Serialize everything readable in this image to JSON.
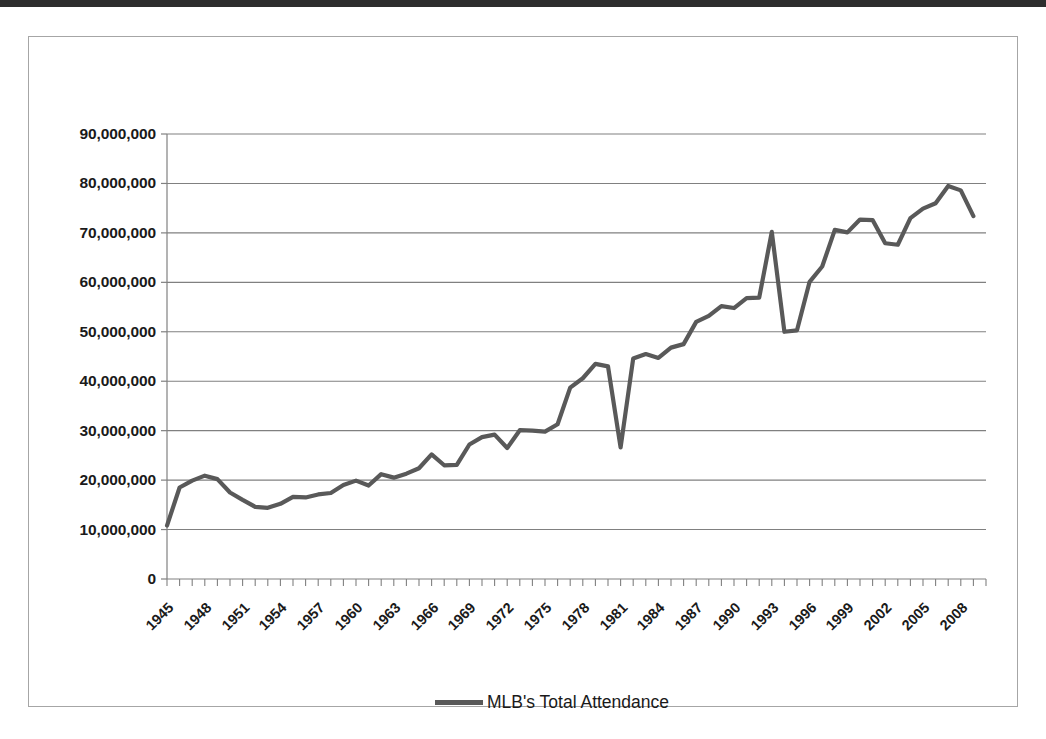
{
  "chart_data": {
    "type": "line",
    "title": "",
    "subtitle": "",
    "xlabel": "",
    "ylabel": "",
    "grid": "horizontal",
    "legend_position": "bottom-center",
    "ylim": [
      0,
      90000000
    ],
    "ytick_values": [
      0,
      10000000,
      20000000,
      30000000,
      40000000,
      50000000,
      60000000,
      70000000,
      80000000,
      90000000
    ],
    "ytick_labels": [
      "0",
      "10,000,000",
      "20,000,000",
      "30,000,000",
      "40,000,000",
      "50,000,000",
      "60,000,000",
      "70,000,000",
      "80,000,000",
      "90,000,000"
    ],
    "xlim": [
      1945,
      2010
    ],
    "xtick_labels": [
      "1945",
      "1948",
      "1951",
      "1954",
      "1957",
      "1960",
      "1963",
      "1966",
      "1969",
      "1972",
      "1975",
      "1978",
      "1981",
      "1984",
      "1987",
      "1990",
      "1993",
      "1996",
      "1999",
      "2002",
      "2005",
      "2008"
    ],
    "xtick_step_years": 3,
    "x": [
      1945,
      1946,
      1947,
      1948,
      1949,
      1950,
      1951,
      1952,
      1953,
      1954,
      1955,
      1956,
      1957,
      1958,
      1959,
      1960,
      1961,
      1962,
      1963,
      1964,
      1965,
      1966,
      1967,
      1968,
      1969,
      1970,
      1971,
      1972,
      1973,
      1974,
      1975,
      1976,
      1977,
      1978,
      1979,
      1980,
      1981,
      1982,
      1983,
      1984,
      1985,
      1986,
      1987,
      1988,
      1989,
      1990,
      1991,
      1992,
      1993,
      1994,
      1995,
      1996,
      1997,
      1998,
      1999,
      2000,
      2001,
      2002,
      2003,
      2004,
      2005,
      2006,
      2007,
      2008,
      2009
    ],
    "series": [
      {
        "name": "MLB's Total Attendance",
        "color": "#595959",
        "values": [
          10800000,
          18500000,
          19900000,
          20900000,
          20200000,
          17500000,
          16000000,
          14600000,
          14400000,
          15200000,
          16600000,
          16500000,
          17100000,
          17400000,
          19000000,
          19900000,
          18900000,
          21200000,
          20500000,
          21300000,
          22400000,
          25200000,
          23000000,
          23100000,
          27200000,
          28700000,
          29200000,
          26500000,
          30100000,
          30000000,
          29800000,
          31300000,
          38700000,
          40600000,
          43500000,
          43000000,
          26600000,
          44600000,
          45500000,
          44700000,
          46800000,
          47500000,
          52000000,
          53200000,
          55200000,
          54800000,
          56800000,
          56900000,
          70200000,
          50000000,
          50300000,
          60100000,
          63200000,
          70600000,
          70100000,
          72700000,
          72600000,
          67900000,
          67600000,
          73000000,
          74900000,
          76000000,
          79500000,
          78600000,
          73400000
        ]
      }
    ]
  },
  "yaxis": {
    "labels": [
      "90,000,000",
      "80,000,000",
      "70,000,000",
      "60,000,000",
      "50,000,000",
      "40,000,000",
      "30,000,000",
      "20,000,000",
      "10,000,000",
      "0"
    ]
  },
  "xaxis": {
    "labels": [
      "1945",
      "1948",
      "1951",
      "1954",
      "1957",
      "1960",
      "1963",
      "1966",
      "1969",
      "1972",
      "1975",
      "1978",
      "1981",
      "1984",
      "1987",
      "1990",
      "1993",
      "1996",
      "1999",
      "2002",
      "2005",
      "2008"
    ]
  },
  "legend": {
    "series_label": "MLB's Total Attendance",
    "line_color": "#595959"
  },
  "colors": {
    "line": "#595959",
    "gridline": "#808080",
    "axis": "#808080",
    "frame": "#a6a6a6",
    "text": "#1a1a1a"
  }
}
